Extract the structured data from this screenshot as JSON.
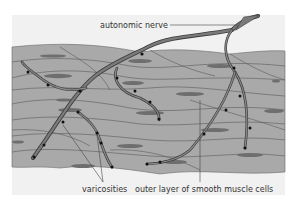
{
  "diagram": {
    "labels": {
      "nerve": "autonomic nerve",
      "varicosities": "varicosities",
      "muscle": "outer layer of smooth muscle cells"
    },
    "colors": {
      "panel": "#f1f1f1",
      "tissue": "#a9a9a9",
      "cell_outline": "#5a5a5a",
      "nucleus": "#6e6e6e",
      "nerve_fill": "#7a7a7a",
      "nerve_outline": "#3a3a3a",
      "varicosity": "#111111",
      "leader": "#444444"
    }
  }
}
